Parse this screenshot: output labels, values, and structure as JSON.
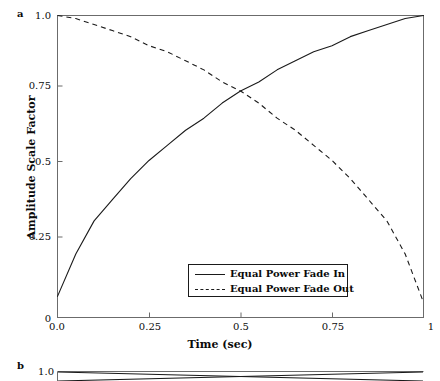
{
  "figure": {
    "panel_a_label": "a",
    "panel_b_label": "b"
  },
  "chart_data": {
    "type": "line",
    "title": "",
    "xlabel": "Time (sec)",
    "ylabel": "Amplitude Scale Factor",
    "xlim": [
      0,
      1
    ],
    "ylim": [
      0,
      1
    ],
    "grid": false,
    "legend_position": "lower center",
    "xticks": [
      0,
      0.25,
      0.5,
      0.75,
      1
    ],
    "xticklabels": [
      "0.0",
      "0.25",
      "0.5",
      "0.75",
      "1"
    ],
    "yticks": [
      0,
      0.25,
      0.5,
      0.75,
      1
    ],
    "yticklabels": [
      "0",
      "0.25",
      "0.5",
      "0.75",
      "1.0"
    ],
    "series": [
      {
        "name": "Equal Power Fade In",
        "style": "solid",
        "color": "#1a1a1a",
        "x": [
          0,
          0.05,
          0.1,
          0.15,
          0.2,
          0.25,
          0.3,
          0.35,
          0.4,
          0.45,
          0.5,
          0.55,
          0.6,
          0.65,
          0.7,
          0.75,
          0.8,
          0.85,
          0.9,
          0.95,
          1
        ],
        "values": [
          0.07,
          0.21,
          0.32,
          0.39,
          0.46,
          0.52,
          0.57,
          0.62,
          0.66,
          0.71,
          0.75,
          0.78,
          0.82,
          0.85,
          0.88,
          0.9,
          0.93,
          0.95,
          0.97,
          0.99,
          1.0
        ]
      },
      {
        "name": "Equal Power Fade Out",
        "style": "dashed",
        "color": "#1a1a1a",
        "x": [
          0,
          0.05,
          0.1,
          0.15,
          0.2,
          0.25,
          0.3,
          0.35,
          0.4,
          0.45,
          0.5,
          0.55,
          0.6,
          0.65,
          0.7,
          0.75,
          0.8,
          0.85,
          0.9,
          0.95,
          1
        ],
        "values": [
          1.0,
          0.99,
          0.97,
          0.95,
          0.93,
          0.9,
          0.88,
          0.85,
          0.82,
          0.78,
          0.75,
          0.71,
          0.66,
          0.62,
          0.57,
          0.52,
          0.46,
          0.39,
          0.32,
          0.21,
          0.05
        ]
      }
    ],
    "panel_b": {
      "yticklabels": [
        "1.0"
      ],
      "series": [
        {
          "name": "panel-b-line-1",
          "style": "solid",
          "color": "#1a1a1a"
        },
        {
          "name": "panel-b-line-2",
          "style": "solid",
          "color": "#1a1a1a"
        }
      ]
    }
  },
  "colors": {
    "line": "#1a1a1a",
    "axis": "#6b6b6b",
    "text": "#0a0a0a",
    "background": "#ffffff"
  }
}
